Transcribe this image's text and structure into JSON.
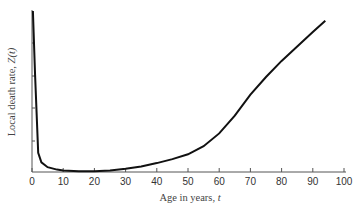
{
  "chart_data": {
    "type": "line",
    "title": "",
    "xlabel": "Age in years, t",
    "ylabel": "Local death rate, Z(t)",
    "xlim": [
      0,
      100
    ],
    "x_ticks": [
      0,
      10,
      20,
      30,
      40,
      50,
      60,
      70,
      80,
      90,
      100
    ],
    "y_ticks_labeled": false,
    "grid": false,
    "series": [
      {
        "name": "Z(t)",
        "x": [
          0.3,
          1,
          2,
          3,
          5,
          8,
          10,
          15,
          20,
          25,
          30,
          35,
          40,
          45,
          50,
          55,
          60,
          65,
          70,
          75,
          80,
          85,
          90,
          94
        ],
        "y": [
          100,
          60,
          12,
          6,
          3,
          1.5,
          1,
          0.5,
          0.5,
          1,
          2,
          3.5,
          5.5,
          8,
          11,
          16,
          24,
          35,
          48,
          59,
          69,
          78,
          87,
          94
        ]
      }
    ]
  },
  "labels": {
    "x_axis": "Age in years, ",
    "x_var": "t",
    "y_axis": "Local death rate, ",
    "y_var": "Z(t)"
  }
}
